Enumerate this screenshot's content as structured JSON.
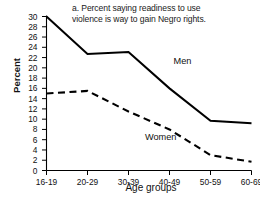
{
  "chart_data": {
    "type": "line",
    "title": "a. Percent saying readiness to use\nviolence is way to gain Negro rights.",
    "xlabel": "Age groups",
    "ylabel": "Percent",
    "categories": [
      "16-19",
      "20-29",
      "30-39",
      "40-49",
      "50-59",
      "60-69"
    ],
    "ylim": [
      0,
      30
    ],
    "yticks": [
      0,
      2,
      4,
      6,
      8,
      10,
      12,
      14,
      16,
      18,
      20,
      22,
      24,
      26,
      28,
      30
    ],
    "ytick_labels": [
      "0",
      "2",
      "4",
      "6",
      "8",
      "10",
      "12",
      "14",
      "16",
      "18",
      "20",
      "22",
      "24",
      "26",
      "28",
      "30"
    ],
    "grid": false,
    "legend_position": "inline-annotations",
    "series": [
      {
        "name": "Men",
        "style": "solid",
        "color": "#000000",
        "values": [
          30.0,
          22.7,
          23.1,
          16.0,
          9.7,
          9.2
        ]
      },
      {
        "name": "Women",
        "style": "dashed",
        "color": "#000000",
        "values": [
          15.0,
          15.5,
          11.5,
          8.0,
          3.0,
          1.7
        ]
      }
    ],
    "annotations": [
      {
        "text": "Men",
        "series": "Men",
        "x_frac": 0.62,
        "y_value": 21.2
      },
      {
        "text": "Women",
        "series": "Women",
        "x_frac": 0.48,
        "y_value": 6.3
      }
    ]
  }
}
